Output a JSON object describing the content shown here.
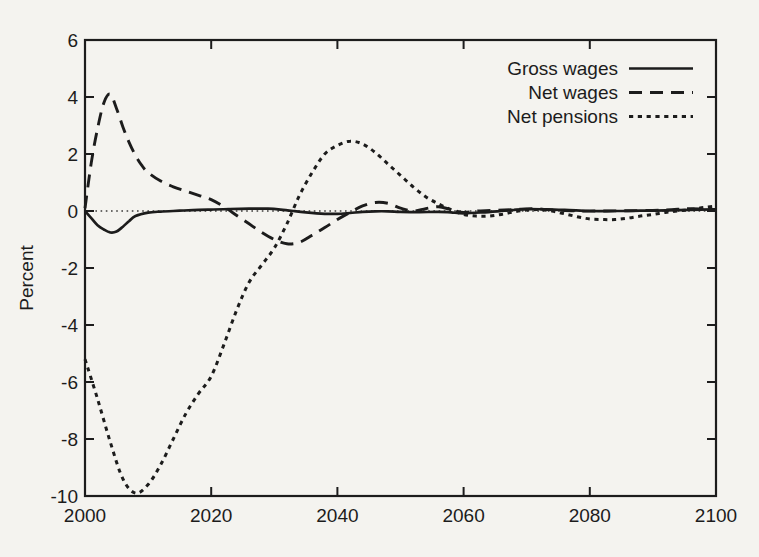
{
  "colors": {
    "paper": "#f4f3ef",
    "ink": "#1c1c1c"
  },
  "chart_data": {
    "type": "line",
    "title": "",
    "xlabel": "",
    "ylabel": "Percent",
    "xlim": [
      2000,
      2100
    ],
    "ylim": [
      -10,
      6
    ],
    "x_ticks": [
      "2000",
      "2020",
      "2040",
      "2060",
      "2080",
      "2100"
    ],
    "y_ticks": [
      "6",
      "4",
      "2",
      "0",
      "-2",
      "-4",
      "-6",
      "-8",
      "-10"
    ],
    "y_tick_values": [
      6,
      4,
      2,
      0,
      -2,
      -4,
      -6,
      -8,
      -10
    ],
    "x_tick_values": [
      2000,
      2020,
      2040,
      2060,
      2080,
      2100
    ],
    "grid": false,
    "zero_line": true,
    "ticks_mirrored_inward": true,
    "legend_position": "top-right-inside",
    "series": [
      {
        "name": "Gross wages",
        "style": "solid",
        "x": [
          2000,
          2001,
          2002,
          2003,
          2004,
          2005,
          2006,
          2007,
          2008,
          2010,
          2012,
          2015,
          2018,
          2020,
          2023,
          2026,
          2029,
          2031,
          2033,
          2035,
          2038,
          2040,
          2042,
          2044,
          2046,
          2048,
          2050,
          2053,
          2056,
          2058,
          2060,
          2063,
          2066,
          2068,
          2070,
          2073,
          2076,
          2080,
          2084,
          2088,
          2092,
          2096,
          2100
        ],
        "y": [
          0,
          -0.25,
          -0.5,
          -0.65,
          -0.75,
          -0.72,
          -0.55,
          -0.35,
          -0.18,
          -0.06,
          -0.02,
          0.01,
          0.04,
          0.05,
          0.07,
          0.08,
          0.08,
          0.05,
          0,
          -0.05,
          -0.1,
          -0.1,
          -0.07,
          -0.03,
          -0.01,
          -0.01,
          -0.03,
          -0.04,
          -0.03,
          -0.05,
          -0.08,
          -0.05,
          0,
          0.04,
          0.07,
          0.06,
          0.04,
          0,
          0,
          0.01,
          0.02,
          0.04,
          0.06
        ]
      },
      {
        "name": "Net wages",
        "style": "long-dash",
        "x": [
          2000,
          2001,
          2002,
          2003,
          2004,
          2005,
          2006,
          2007,
          2008,
          2009,
          2010,
          2012,
          2014,
          2016,
          2018,
          2020,
          2022,
          2024,
          2026,
          2028,
          2030,
          2032,
          2034,
          2036,
          2038,
          2040,
          2042,
          2044,
          2046,
          2048,
          2050,
          2052,
          2054,
          2056,
          2058,
          2060,
          2062,
          2065,
          2068,
          2071,
          2074,
          2078,
          2082,
          2086,
          2090,
          2093,
          2096,
          2100
        ],
        "y": [
          0.1,
          1.7,
          2.9,
          3.8,
          4.1,
          3.6,
          2.95,
          2.4,
          1.95,
          1.6,
          1.35,
          1.05,
          0.85,
          0.7,
          0.55,
          0.4,
          0.15,
          -0.15,
          -0.45,
          -0.75,
          -1.0,
          -1.15,
          -1.1,
          -0.85,
          -0.58,
          -0.3,
          -0.05,
          0.18,
          0.3,
          0.27,
          0.1,
          0,
          0.08,
          0.15,
          0.05,
          -0.05,
          0,
          0.02,
          0.05,
          0.08,
          0.04,
          0,
          0,
          0.01,
          0.02,
          0.05,
          0.08,
          0.05
        ]
      },
      {
        "name": "Net pensions",
        "style": "short-dash",
        "x": [
          2000,
          2002,
          2004,
          2006,
          2008,
          2010,
          2012,
          2014,
          2016,
          2018,
          2020,
          2022,
          2024,
          2026,
          2028,
          2030,
          2032,
          2034,
          2036,
          2038,
          2040,
          2042,
          2044,
          2046,
          2048,
          2050,
          2052,
          2054,
          2056,
          2058,
          2060,
          2062,
          2064,
          2066,
          2068,
          2070,
          2072,
          2074,
          2076,
          2078,
          2080,
          2082,
          2084,
          2086,
          2088,
          2090,
          2092,
          2094,
          2096,
          2098,
          2100
        ],
        "y": [
          -5.2,
          -6.6,
          -8.1,
          -9.4,
          -9.9,
          -9.6,
          -8.9,
          -8.0,
          -7.1,
          -6.4,
          -5.8,
          -4.7,
          -3.5,
          -2.5,
          -1.9,
          -1.3,
          -0.45,
          0.55,
          1.35,
          2.0,
          2.3,
          2.45,
          2.35,
          2.05,
          1.65,
          1.25,
          0.85,
          0.5,
          0.25,
          0.05,
          -0.12,
          -0.18,
          -0.18,
          -0.12,
          -0.03,
          0.03,
          0.05,
          0,
          -0.1,
          -0.2,
          -0.28,
          -0.3,
          -0.3,
          -0.25,
          -0.18,
          -0.12,
          -0.05,
          0,
          0.05,
          0.12,
          0.17
        ]
      }
    ]
  }
}
